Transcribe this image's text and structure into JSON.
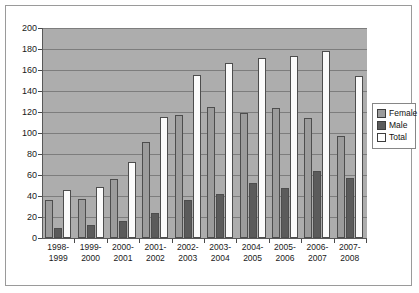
{
  "chart_data": {
    "type": "bar",
    "title": "",
    "subtitle": "",
    "xlabel": "",
    "ylabel": "",
    "ylim": [
      0,
      200
    ],
    "ytick_step": 20,
    "yticks": [
      200,
      180,
      160,
      140,
      120,
      100,
      80,
      60,
      40,
      20,
      0
    ],
    "grid": true,
    "legend_position": "right",
    "categories": [
      "1998-1999",
      "1999-2000",
      "2000-2001",
      "2001-2002",
      "2002-2003",
      "2003-2004",
      "2004-2005",
      "2005-2006",
      "2006-2007",
      "2007-2008"
    ],
    "category_lines": [
      [
        "1998-",
        "1999"
      ],
      [
        "1999-",
        "2000"
      ],
      [
        "2000-",
        "2001"
      ],
      [
        "2001-",
        "2002"
      ],
      [
        "2002-",
        "2003"
      ],
      [
        "2003-",
        "2004"
      ],
      [
        "2004-",
        "2005"
      ],
      [
        "2005-",
        "2006"
      ],
      [
        "2006-",
        "2007"
      ],
      [
        "2007-",
        "2008"
      ]
    ],
    "series": [
      {
        "name": "Female",
        "color": "#9c9c9c",
        "values": [
          36,
          37,
          56,
          91,
          117,
          125,
          119,
          124,
          114,
          97
        ]
      },
      {
        "name": "Male",
        "color": "#5b5b5b",
        "values": [
          10,
          12,
          16,
          24,
          36,
          42,
          52,
          48,
          64,
          57
        ]
      },
      {
        "name": "Total",
        "color": "#ffffff",
        "values": [
          46,
          49,
          72,
          115,
          155,
          167,
          171,
          173,
          178,
          154
        ]
      }
    ]
  },
  "legend": {
    "items": [
      {
        "label": "Female",
        "key": "female"
      },
      {
        "label": "Male",
        "key": "male"
      },
      {
        "label": "Total",
        "key": "total"
      }
    ]
  },
  "colors": {
    "plot_background": "#adadad",
    "frame_border": "#9a9a9a",
    "gridline": "#7d7d7d",
    "axis": "#585858",
    "text": "#1a1a1a"
  }
}
